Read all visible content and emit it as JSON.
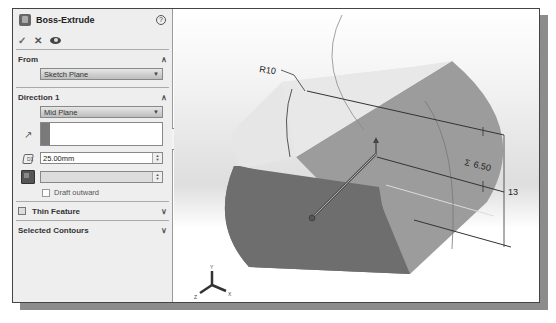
{
  "property_manager": {
    "title": "Boss-Extrude",
    "help_icon": "?",
    "actions": {
      "ok": "✓",
      "cancel": "✕",
      "preview": "eye-icon"
    },
    "from": {
      "header": "From",
      "value": "Sketch Plane"
    },
    "direction1": {
      "header": "Direction 1",
      "end_condition": "Mid Plane",
      "depth": "25.00mm",
      "face_value": "",
      "draft_outward_label": "Draft outward",
      "draft_outward_checked": false
    },
    "thin_feature": {
      "header": "Thin Feature",
      "checked": false
    },
    "selected_contours": {
      "header": "Selected Contours"
    }
  },
  "graphics": {
    "dimensions": {
      "radius": "R10",
      "offset": "6.50",
      "offset_symbol": "Σ",
      "height": "13"
    },
    "triad": {
      "x": "X",
      "y": "Y",
      "z": "Z"
    },
    "colors": {
      "dark_face": "#6e6e6e",
      "mid_face": "#9a9a9a",
      "light_face": "#e4e4e4"
    }
  }
}
